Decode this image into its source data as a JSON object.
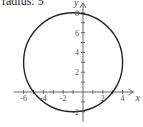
{
  "caption": "radius: 5",
  "chart_data": {
    "type": "line",
    "title": "radius: 5",
    "center": [
      -1,
      3
    ],
    "radius": 5,
    "xlabel": "x",
    "ylabel": "y",
    "xlim": [
      -7,
      5
    ],
    "ylim": [
      -3,
      9
    ],
    "x_tick_labels": [
      "-6",
      "-4",
      "-2",
      "2",
      "4"
    ],
    "y_tick_labels": [
      "-2",
      "2",
      "4",
      "6",
      "8"
    ],
    "grid": false
  },
  "axes": {
    "x_label": "x",
    "y_label": "y",
    "x_ticks": [
      {
        "value": -6,
        "label": "-6"
      },
      {
        "value": -4,
        "label": "-4"
      },
      {
        "value": -2,
        "label": "-2"
      },
      {
        "value": 2,
        "label": "2"
      },
      {
        "value": 4,
        "label": "4"
      }
    ],
    "y_ticks": [
      {
        "value": -2,
        "label": "-2"
      },
      {
        "value": 2,
        "label": "2"
      },
      {
        "value": 4,
        "label": "4"
      },
      {
        "value": 6,
        "label": "6"
      },
      {
        "value": 8,
        "label": "8"
      }
    ]
  }
}
